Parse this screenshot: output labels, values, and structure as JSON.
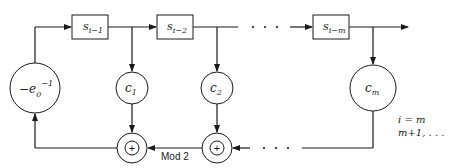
{
  "diagram": {
    "type": "linear feedback shift register (mod 2)",
    "registers": [
      {
        "id": "s1",
        "base": "s",
        "sub": "i−1"
      },
      {
        "id": "s2",
        "base": "s",
        "sub": "i−2"
      },
      {
        "id": "sm",
        "base": "s",
        "sub": "i−m"
      }
    ],
    "multipliers": [
      {
        "id": "c1",
        "base": "c",
        "sub": "1"
      },
      {
        "id": "c2",
        "base": "c",
        "sub": "2"
      },
      {
        "id": "cm",
        "base": "c",
        "sub": "m"
      }
    ],
    "feedback": {
      "prefix": "−e",
      "sub": "0",
      "sup": "−1"
    },
    "adders": [
      {
        "id": "add1",
        "symbol": "+"
      },
      {
        "id": "add2",
        "symbol": "+"
      }
    ],
    "adder_label": "Mod 2",
    "ellipsis": "· · ·",
    "index_label": {
      "line1": "i = m",
      "line2": "m+1, . . ."
    },
    "colors": {
      "stroke": "#1a1a1a",
      "background": "#ffffff"
    }
  }
}
